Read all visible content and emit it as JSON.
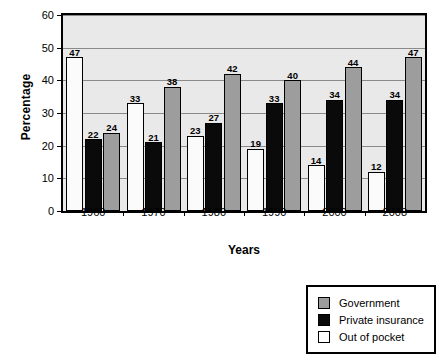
{
  "chart_data": {
    "type": "bar",
    "title": "",
    "xlabel": "Years",
    "ylabel": "Percentage",
    "categories": [
      "1960",
      "1970",
      "1980",
      "1990",
      "2000",
      "2008"
    ],
    "series": [
      {
        "name": "Out of pocket",
        "color": "#ffffff",
        "values": [
          47,
          33,
          23,
          19,
          14,
          12
        ]
      },
      {
        "name": "Private insurance",
        "color": "#0a0a0a",
        "values": [
          22,
          21,
          27,
          33,
          34,
          34
        ]
      },
      {
        "name": "Government",
        "color": "#9d9d9d",
        "values": [
          24,
          38,
          42,
          40,
          44,
          47
        ]
      }
    ],
    "ylim": [
      0,
      60
    ],
    "yticks": [
      0,
      10,
      20,
      30,
      40,
      50,
      60
    ],
    "grid": true,
    "legend_position": "bottom-right",
    "legend_order": [
      "Government",
      "Private insurance",
      "Out of pocket"
    ],
    "plot_background": "#e9e9e9",
    "gridline_color": "#8a8a8a",
    "axis_color": "#000000"
  }
}
